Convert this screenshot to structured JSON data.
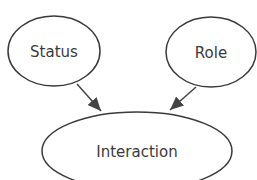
{
  "diagram": {
    "nodes": [
      {
        "id": "status",
        "label": "Status"
      },
      {
        "id": "role",
        "label": "Role"
      },
      {
        "id": "interaction",
        "label": "Interaction"
      }
    ],
    "edges": [
      {
        "from": "status",
        "to": "interaction"
      },
      {
        "from": "role",
        "to": "interaction"
      }
    ],
    "colors": {
      "stroke": "#3a3a3a",
      "background": "#ffffff"
    }
  }
}
